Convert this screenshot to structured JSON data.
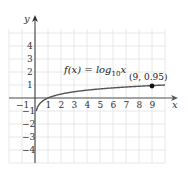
{
  "chart_data": {
    "type": "line",
    "title": "",
    "function_label": "f(x) = log",
    "function_base": "10",
    "function_var": "x",
    "xlabel": "x",
    "ylabel": "y",
    "xlim": [
      -2,
      10
    ],
    "ylim": [
      -5,
      5
    ],
    "grid": true,
    "x_ticks": [
      "-1",
      "1",
      "2",
      "3",
      "4",
      "5",
      "6",
      "7",
      "8",
      "9"
    ],
    "y_ticks": [
      "4",
      "3",
      "2",
      "1",
      "-1",
      "-2",
      "-3",
      "-4"
    ],
    "series": [
      {
        "name": "f(x) = log10 x",
        "x": [
          0.1,
          0.2,
          0.5,
          1,
          2,
          3,
          4,
          5,
          6,
          7,
          8,
          9,
          10
        ],
        "y": [
          -1,
          -0.7,
          -0.3,
          0,
          0.3,
          0.48,
          0.6,
          0.7,
          0.78,
          0.85,
          0.9,
          0.95,
          1.0
        ]
      }
    ],
    "annotations": [
      {
        "label": "(9, 0.95)",
        "x": 9,
        "y": 0.95,
        "marker": "dot"
      }
    ]
  }
}
